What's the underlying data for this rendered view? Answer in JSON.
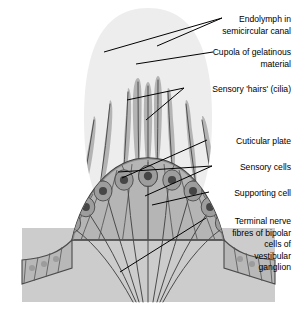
{
  "figure": {
    "background": "#ffffff"
  },
  "palette": {
    "endolymph": "#f2f2f2",
    "cupola": "#ececec",
    "cilia": "#b0b0b0",
    "epithelium": "#b3b3b3",
    "sensory_cell_body": "#9a9a9a",
    "sensory_cell_nucleus": "#4a4a4a",
    "supporting_cell": "#b8b8b8",
    "supporting_nucleus": "#9c9c9c",
    "basal_tissue": "#cccccc",
    "outline": "#3a3a3a",
    "nerve_fibre": "#4a4a4a",
    "leader_line": "#000000",
    "text": "#000000"
  },
  "labels": [
    {
      "id": "endolymph",
      "name": "label-endolymph",
      "lines": [
        "Endolymph in",
        "semicircular canal"
      ],
      "x": 291,
      "y": 22,
      "line_height": 11.5
    },
    {
      "id": "cupola",
      "name": "label-cupola",
      "lines": [
        "Cupola of gelatinous",
        "material"
      ],
      "x": 291,
      "y": 55,
      "line_height": 11.5
    },
    {
      "id": "cilia",
      "name": "label-sensory-hairs",
      "lines": [
        "Sensory 'hairs' (cilia)"
      ],
      "x": 291,
      "y": 92,
      "line_height": 11.5
    },
    {
      "id": "cuticular",
      "name": "label-cuticular-plate",
      "lines": [
        "Cuticular plate"
      ],
      "x": 291,
      "y": 144,
      "line_height": 11.5
    },
    {
      "id": "sensory",
      "name": "label-sensory-cells",
      "lines": [
        "Sensory cells"
      ],
      "x": 291,
      "y": 170,
      "line_height": 11.5
    },
    {
      "id": "supporting",
      "name": "label-supporting-cell",
      "lines": [
        "Supporting cell"
      ],
      "x": 291,
      "y": 196,
      "line_height": 11.5
    },
    {
      "id": "terminal",
      "name": "label-terminal-nerve-fibres",
      "lines": [
        "Terminal nerve",
        "fibres of bipolar",
        "cells of",
        "vestibular",
        "ganglion"
      ],
      "x": 291,
      "y": 224,
      "line_height": 11.5
    }
  ],
  "leader_lines": [
    {
      "name": "leader-endolymph-a",
      "x1": 222,
      "y1": 18,
      "x2": 104,
      "y2": 52
    },
    {
      "name": "leader-endolymph-b",
      "x1": 222,
      "y1": 18,
      "x2": 157,
      "y2": 46
    },
    {
      "name": "leader-cupola",
      "x1": 213,
      "y1": 52,
      "x2": 136,
      "y2": 64
    },
    {
      "name": "leader-cilia-a",
      "x1": 184,
      "y1": 88,
      "x2": 127,
      "y2": 100
    },
    {
      "name": "leader-cilia-b",
      "x1": 184,
      "y1": 88,
      "x2": 146,
      "y2": 120
    },
    {
      "name": "leader-cuticular",
      "x1": 207,
      "y1": 140,
      "x2": 122,
      "y2": 178
    },
    {
      "name": "leader-sensory-a",
      "x1": 212,
      "y1": 166,
      "x2": 118,
      "y2": 172
    },
    {
      "name": "leader-sensory-b",
      "x1": 212,
      "y1": 166,
      "x2": 145,
      "y2": 196
    },
    {
      "name": "leader-supporting",
      "x1": 209,
      "y1": 192,
      "x2": 152,
      "y2": 205
    },
    {
      "name": "leader-terminal",
      "x1": 206,
      "y1": 218,
      "x2": 120,
      "y2": 272
    }
  ],
  "structures": {
    "cupola_label": "Cupola dome",
    "crista_label": "Crista ampullaris epithelium",
    "cilia_count": 11,
    "sensory_cell_count": 10,
    "nerve_fibre_count": 9
  }
}
